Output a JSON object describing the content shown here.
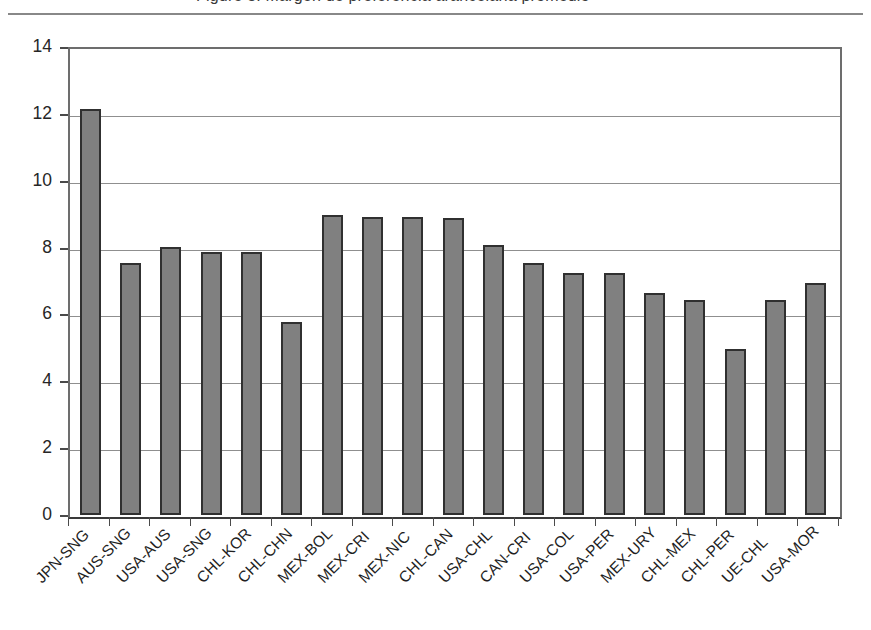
{
  "figure": {
    "clipped_title": "Figure 3. Margen de preferencia arancelaria promedio",
    "top_rule": true
  },
  "chart_data": {
    "type": "bar",
    "title": "",
    "subtitle": "",
    "xlabel": "",
    "ylabel": "",
    "ylim": [
      0,
      14
    ],
    "yticks": [
      0,
      2,
      4,
      6,
      8,
      10,
      12,
      14
    ],
    "ytick_labels": [
      "0",
      "2",
      "4",
      "6",
      "8",
      "10",
      "12",
      "14"
    ],
    "grid": "horizontal",
    "legend": "none",
    "bar_color": "#808080",
    "bar_edge_color": "#303030",
    "categories": [
      "JPN-SNG",
      "AUS-SNG",
      "USA-AUS",
      "USA-SNG",
      "CHL-KOR",
      "CHL-CHN",
      "MEX-BOL",
      "MEX-CRI",
      "MEX-NIC",
      "CHL-CAN",
      "USA-CHL",
      "CAN-CRI",
      "USA-COL",
      "USA-PER",
      "MEX-URY",
      "CHL-MEX",
      "CHL-PER",
      "UE-CHL",
      "USA-MOR"
    ],
    "values": [
      12.25,
      7.6,
      8.1,
      7.95,
      7.95,
      5.82,
      9.05,
      9.0,
      9.0,
      8.95,
      8.15,
      7.6,
      7.3,
      7.3,
      6.7,
      6.5,
      5.0,
      6.5,
      7.0
    ]
  }
}
